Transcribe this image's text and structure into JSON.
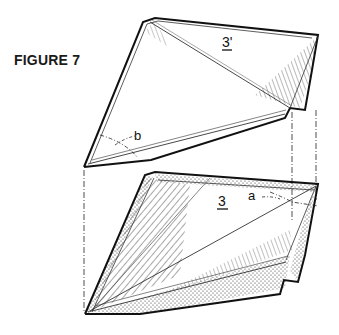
{
  "figure": {
    "title": "FIGURE 7",
    "labels": {
      "top_piece": "3'",
      "bottom_piece": "3",
      "angle_top": "b",
      "angle_bottom": "a"
    }
  },
  "colors": {
    "ink": "#111111",
    "background": "#ffffff"
  }
}
